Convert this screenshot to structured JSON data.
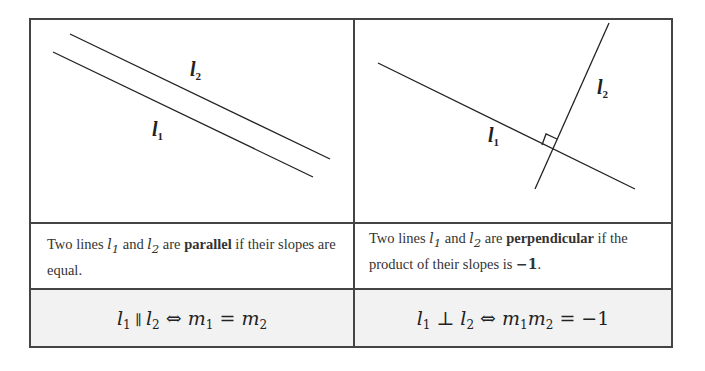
{
  "table": {
    "left_panel": {
      "name": "parallel-diagram",
      "lines": [
        {
          "label": "l",
          "sub": "1",
          "x1": 53,
          "y1": 52,
          "x2": 313,
          "y2": 177
        },
        {
          "label": "l",
          "sub": "2",
          "x1": 70,
          "y1": 34,
          "x2": 330,
          "y2": 159
        }
      ]
    },
    "right_panel": {
      "name": "perpendicular-diagram",
      "lines": [
        {
          "label": "l",
          "sub": "1",
          "x1": 378,
          "y1": 63,
          "x2": 635,
          "y2": 189
        },
        {
          "label": "l",
          "sub": "2",
          "x1": 609,
          "y1": 23,
          "x2": 535,
          "y2": 189
        }
      ],
      "right_angle_marker": true
    },
    "descriptions": {
      "parallel": {
        "pre": "Two lines ",
        "l1": "l",
        "l1_sub": "1",
        "and": " and ",
        "l2": "l",
        "l2_sub": "2",
        "are": " are ",
        "bold": "parallel",
        "post": " if their slopes are equal."
      },
      "perpendicular": {
        "pre": "Two lines ",
        "l1": "l",
        "l1_sub": "1",
        "and": " and ",
        "l2": "l",
        "l2_sub": "2",
        "are": " are ",
        "bold": "perpendicular",
        "post": " if the product of their slopes is ",
        "value": "−1",
        "end": "."
      }
    },
    "formulas": {
      "parallel": {
        "l1": "l",
        "s1": "1",
        "rel": " ∥ ",
        "l2": "l",
        "s2": "2",
        "iff": " ⇔ ",
        "m1": "m",
        "ms1": "1",
        "eq": " = ",
        "m2": "m",
        "ms2": "2"
      },
      "perpendicular": {
        "l1": "l",
        "s1": "1",
        "rel": " ⊥ ",
        "l2": "l",
        "s2": "2",
        "iff": " ⇔ ",
        "m1": "m",
        "ms1": "1",
        "m2": "m",
        "ms2": "2",
        "eq": " = ",
        "rhs": "−1"
      }
    },
    "colors": {
      "border": "#444444",
      "formula_bg": "#f2f2f2",
      "line": "#222222"
    }
  }
}
